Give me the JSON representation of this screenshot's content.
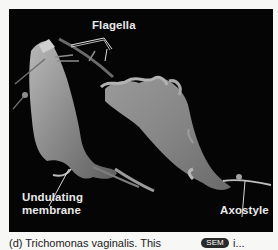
{
  "figure": {
    "panel_background": "#050505",
    "label_color": "#e9e9e9",
    "labels": {
      "flagella": "Flagella",
      "undulating_membrane_line1": "Undulating",
      "undulating_membrane_line2": "membrane",
      "axostyle": "Axostyle"
    }
  },
  "caption": {
    "text": "(d) Trichomonas vaginalis. This",
    "badge": "SEM",
    "rest": "i..."
  }
}
